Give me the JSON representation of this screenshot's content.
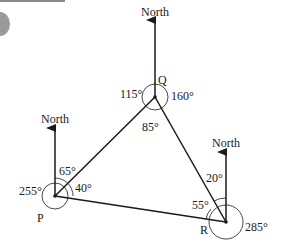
{
  "diagram": {
    "type": "bearing-triangle",
    "north_label": "North",
    "points": {
      "P": {
        "label": "P",
        "x": 55,
        "y": 196
      },
      "Q": {
        "label": "Q",
        "x": 155,
        "y": 97
      },
      "R": {
        "label": "R",
        "x": 226,
        "y": 222
      }
    },
    "angles": {
      "Q_left": "115°",
      "Q_right": "160°",
      "Q_interior": "85°",
      "P_north": "65°",
      "P_interior": "40°",
      "P_reflex": "255°",
      "R_north": "20°",
      "R_interior": "55°",
      "R_reflex": "285°"
    },
    "colors": {
      "line": "#1a1a1a",
      "decor": "#8a8a8a",
      "background": "#ffffff"
    }
  }
}
